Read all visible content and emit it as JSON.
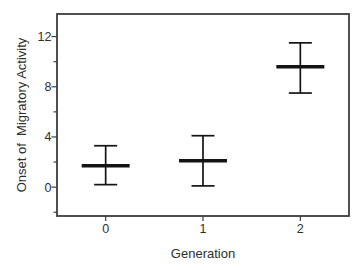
{
  "colors": {
    "background": "#ffffff",
    "axis": "#3d3d3d",
    "text": "#2e2e2e",
    "marker": "#141414"
  },
  "chart_data": {
    "type": "errorbar",
    "title": "",
    "xlabel": "Generation",
    "ylabel": "Onset of  Migratory Activity",
    "categories": [
      "0",
      "1",
      "2"
    ],
    "x": [
      0,
      1,
      2
    ],
    "series": [
      {
        "name": "onset-of-migratory-activity",
        "means": [
          1.7,
          2.1,
          9.6
        ],
        "upper": [
          3.3,
          4.1,
          11.5
        ],
        "lower": [
          0.2,
          0.1,
          7.5
        ]
      }
    ],
    "y_ticks": [
      0,
      4,
      8,
      12
    ],
    "y_minor_ticks": [
      -2,
      2,
      6,
      10
    ],
    "xlim": [
      -0.5,
      2.5
    ],
    "ylim": [
      -2.3,
      13.8
    ],
    "grid": false,
    "legend": false,
    "marker_style": "horizontal mean bar with T-capped vertical error bars"
  }
}
